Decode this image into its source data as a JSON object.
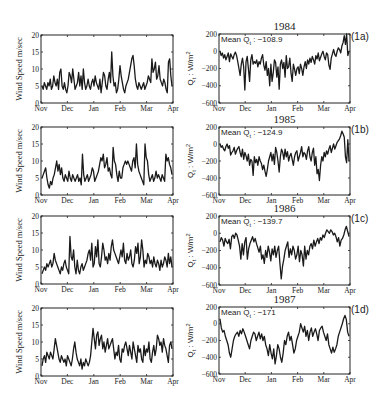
{
  "figure": {
    "months": [
      "Nov",
      "Dec",
      "Jan",
      "Feb",
      "Mar",
      "Apr"
    ],
    "left_ylabel": "Wind Speed m/sec",
    "right_ylabel": "Q_t : W/m^2",
    "left_yticks": [
      "0",
      "5",
      "10",
      "15",
      "20"
    ],
    "right_yticks": [
      "200",
      "0",
      "-200",
      "-400",
      "-600"
    ],
    "line_color": "#1a1a1a"
  },
  "chart_data": [
    {
      "type": "line",
      "panel": "1a-left",
      "title": "",
      "xlabel": "",
      "ylabel": "Wind Speed m/sec",
      "xticks": [
        "Nov",
        "Dec",
        "Jan",
        "Feb",
        "Mar",
        "Apr"
      ],
      "ylim": [
        0,
        20
      ],
      "yticks": [
        0,
        5,
        10,
        15,
        20
      ],
      "values": [
        5,
        4,
        6,
        5,
        4,
        6,
        5,
        7,
        4,
        5,
        8,
        6,
        5,
        7,
        4,
        9,
        10,
        5,
        4,
        6,
        4,
        3,
        5,
        9,
        8,
        6,
        10,
        7,
        4,
        5,
        6,
        9,
        5,
        8,
        4,
        10,
        6,
        4,
        5,
        7,
        5,
        4,
        6,
        7,
        5,
        8,
        6,
        5,
        4,
        7,
        3,
        6,
        9,
        8,
        5,
        4,
        7,
        9,
        6,
        15,
        8,
        5,
        6,
        3,
        4,
        7,
        11,
        8,
        6,
        4,
        3,
        5,
        6,
        7,
        9,
        11,
        13,
        14,
        11,
        7,
        5,
        4,
        6,
        5,
        4,
        5,
        6,
        4,
        5,
        6,
        8,
        7,
        6,
        13,
        9,
        10,
        12,
        7,
        8,
        11,
        7,
        6,
        5,
        7,
        6,
        4,
        3,
        12,
        13,
        8,
        5
      ]
    },
    {
      "type": "line",
      "panel": "1a-right",
      "title": "1984",
      "tag": "(1a)",
      "annotation": "Mean Q_t : -108.9",
      "mean": -108.9,
      "ylabel": "Q_t : W/m^2",
      "xticks": [
        "Nov",
        "Dec",
        "Jan",
        "Feb",
        "Mar",
        "Apr"
      ],
      "ylim": [
        -600,
        200
      ],
      "yticks": [
        200,
        0,
        -200,
        -400,
        -600
      ],
      "values": [
        0,
        -50,
        -20,
        -80,
        -40,
        -100,
        -60,
        -20,
        -120,
        -30,
        -60,
        -90,
        -40,
        -10,
        -50,
        -120,
        -200,
        -280,
        -150,
        -80,
        -180,
        -450,
        -120,
        -60,
        -200,
        -350,
        -100,
        -40,
        -150,
        -120,
        -140,
        -100,
        -180,
        -120,
        -150,
        -80,
        -40,
        -160,
        -220,
        -120,
        -280,
        -200,
        -400,
        -150,
        -350,
        -250,
        -100,
        -130,
        -300,
        -180,
        -440,
        -150,
        -100,
        -200,
        -130,
        -300,
        -50,
        -200,
        -180,
        -80,
        -250,
        -350,
        -150,
        -210,
        -280,
        -200,
        -180,
        -260,
        -150,
        -200,
        -280,
        -180,
        -120,
        -200,
        -100,
        -150,
        -80,
        -130,
        -60,
        -100,
        -150,
        -50,
        -90,
        -20,
        -110,
        -70,
        -30,
        0,
        -60,
        -100,
        -20,
        -40,
        -160,
        -210,
        -80,
        -30,
        20,
        -40,
        -60,
        0,
        40,
        20,
        -20,
        60,
        100,
        180,
        80,
        220,
        -50,
        0
      ]
    },
    {
      "type": "line",
      "panel": "1b-left",
      "ylabel": "Wind Speed m/sec",
      "xticks": [
        "Nov",
        "Dec",
        "Jan",
        "Feb",
        "Mar",
        "Apr"
      ],
      "ylim": [
        0,
        20
      ],
      "yticks": [
        0,
        5,
        10,
        15,
        20
      ],
      "values": [
        5,
        6,
        7,
        8,
        5,
        3,
        2,
        4,
        3,
        5,
        6,
        8,
        10,
        7,
        9,
        6,
        8,
        5,
        4,
        6,
        5,
        4,
        7,
        5,
        4,
        6,
        5,
        4,
        5,
        6,
        4,
        5,
        3,
        12,
        6,
        4,
        5,
        6,
        4,
        5,
        6,
        8,
        7,
        4,
        5,
        6,
        7,
        9,
        11,
        10,
        12,
        8,
        9,
        11,
        7,
        8,
        6,
        5,
        14,
        10,
        9,
        6,
        4,
        7,
        5,
        5,
        8,
        9,
        10,
        9,
        10,
        9,
        8,
        7,
        10,
        11,
        8,
        15,
        9,
        7,
        6,
        5,
        4,
        3,
        15,
        11,
        10,
        6,
        4,
        5,
        6,
        4,
        5,
        7,
        5,
        6,
        5,
        4,
        6,
        5,
        4,
        12,
        10,
        11,
        9,
        8,
        6
      ]
    },
    {
      "type": "line",
      "panel": "1b-right",
      "title": "1985",
      "tag": "(1b)",
      "annotation": "Mean Q_t : -124.9",
      "mean": -124.9,
      "ylabel": "Q_t : W/m^2",
      "xticks": [
        "Nov",
        "Dec",
        "Jan",
        "Feb",
        "Mar",
        "Apr"
      ],
      "ylim": [
        -600,
        200
      ],
      "yticks": [
        200,
        0,
        -200,
        -400,
        -600
      ],
      "values": [
        0,
        -40,
        -20,
        -60,
        -80,
        -30,
        0,
        -50,
        -20,
        -130,
        -100,
        -80,
        -40,
        -120,
        -80,
        -50,
        -30,
        -100,
        -150,
        -60,
        -180,
        -100,
        -140,
        -200,
        -120,
        -250,
        -180,
        -200,
        -370,
        -150,
        -220,
        -180,
        -250,
        -150,
        -200,
        -230,
        -300,
        -250,
        -320,
        -380,
        -300,
        -200,
        -150,
        -100,
        -200,
        -120,
        -240,
        -40,
        -100,
        -200,
        -330,
        -150,
        -60,
        -100,
        -180,
        -60,
        -150,
        -90,
        -200,
        -140,
        -110,
        -180,
        -250,
        -150,
        -100,
        -80,
        -200,
        -150,
        -100,
        -30,
        -150,
        -100,
        -120,
        -180,
        -80,
        -30,
        -150,
        -200,
        -100,
        -50,
        -250,
        -150,
        -350,
        -300,
        -430,
        -250,
        -150,
        -200,
        -100,
        -150,
        -80,
        -120,
        -60,
        -20,
        -100,
        -50,
        0,
        -60,
        -20,
        20,
        40,
        60,
        100,
        150,
        120,
        80,
        -150,
        -220,
        50,
        -200
      ]
    },
    {
      "type": "line",
      "panel": "1c-left",
      "ylabel": "Wind Speed m/sec",
      "xticks": [
        "Nov",
        "Dec",
        "Jan",
        "Feb",
        "Mar",
        "Apr"
      ],
      "ylim": [
        0,
        20
      ],
      "yticks": [
        0,
        5,
        10,
        15,
        20
      ],
      "values": [
        3,
        4,
        5,
        4,
        6,
        5,
        6,
        7,
        5,
        6,
        9,
        7,
        6,
        5,
        4,
        3,
        5,
        4,
        6,
        7,
        5,
        4,
        3,
        14,
        8,
        7,
        10,
        5,
        3,
        7,
        4,
        3,
        5,
        6,
        4,
        5,
        6,
        7,
        9,
        10,
        7,
        12,
        5,
        6,
        11,
        8,
        13,
        6,
        5,
        8,
        12,
        10,
        7,
        8,
        6,
        9,
        7,
        11,
        13,
        10,
        9,
        8,
        7,
        6,
        8,
        10,
        8,
        12,
        7,
        6,
        9,
        7,
        8,
        10,
        6,
        5,
        7,
        11,
        9,
        12,
        6,
        8,
        13,
        10,
        5,
        7,
        6,
        9,
        8,
        6,
        7,
        5,
        8,
        6,
        5,
        7,
        6,
        4,
        7,
        5,
        6,
        8,
        7,
        5,
        9,
        6,
        8,
        5
      ]
    },
    {
      "type": "line",
      "panel": "1c-right",
      "title": "1986",
      "tag": "(1c)",
      "annotation": "Mean Q_t : -139.7",
      "mean": -139.7,
      "ylabel": "Q_t : W/m^2",
      "xticks": [
        "Nov",
        "Dec",
        "Jan",
        "Feb",
        "Mar",
        "Apr"
      ],
      "ylim": [
        -600,
        200
      ],
      "yticks": [
        200,
        0,
        -200,
        -400,
        -600
      ],
      "values": [
        -100,
        -50,
        -80,
        -150,
        -60,
        -100,
        -120,
        -70,
        -180,
        -40,
        -20,
        -60,
        0,
        -20,
        -80,
        -150,
        -300,
        -120,
        -250,
        -100,
        -50,
        -300,
        -180,
        -120,
        -80,
        -40,
        -100,
        -60,
        -120,
        -170,
        -220,
        -150,
        -300,
        -250,
        -350,
        -200,
        -280,
        -150,
        -220,
        -320,
        -180,
        -250,
        -150,
        -280,
        -200,
        -150,
        -350,
        -530,
        -380,
        -300,
        -200,
        -150,
        -100,
        -280,
        -180,
        -250,
        -150,
        -200,
        -300,
        -250,
        -150,
        -330,
        -200,
        -250,
        -380,
        -150,
        -300,
        -200,
        -250,
        -150,
        -120,
        -180,
        -80,
        -150,
        -100,
        -60,
        -120,
        -50,
        -80,
        -20,
        -50,
        0,
        40,
        20,
        0,
        40,
        20,
        -20,
        0,
        -40,
        -100,
        -50,
        -150,
        -80,
        -60,
        -20,
        40,
        80,
        20,
        -40
      ]
    },
    {
      "type": "line",
      "panel": "1d-left",
      "ylabel": "Wind Speed m/sec",
      "xticks": [
        "Nov",
        "Dec",
        "Jan",
        "Feb",
        "Mar",
        "Apr"
      ],
      "ylim": [
        0,
        20
      ],
      "yticks": [
        0,
        5,
        10,
        15,
        20
      ],
      "values": [
        3,
        5,
        6,
        4,
        7,
        6,
        5,
        7,
        6,
        5,
        8,
        11,
        9,
        7,
        5,
        4,
        6,
        5,
        4,
        5,
        3,
        6,
        5,
        4,
        3,
        5,
        8,
        10,
        7,
        5,
        4,
        3,
        5,
        2,
        4,
        3,
        5,
        4,
        3,
        4,
        6,
        10,
        14,
        11,
        8,
        12,
        13,
        9,
        11,
        12,
        8,
        10,
        7,
        9,
        11,
        8,
        9,
        10,
        11,
        8,
        5,
        7,
        6,
        9,
        5,
        4,
        8,
        7,
        9,
        10,
        8,
        6,
        9,
        7,
        5,
        10,
        8,
        6,
        4,
        9,
        7,
        8,
        5,
        4,
        9,
        6,
        8,
        7,
        10,
        5,
        4,
        7,
        9,
        6,
        8,
        12,
        11,
        9,
        10,
        7,
        11,
        9,
        8,
        6,
        4,
        9,
        10,
        8
      ]
    },
    {
      "type": "line",
      "panel": "1d-right",
      "title": "1987",
      "tag": "(1d)",
      "annotation": "Mean Q_t : -171",
      "mean": -171,
      "ylabel": "Q_t : W/m^2",
      "xticks": [
        "Nov",
        "Dec",
        "Jan",
        "Feb",
        "Mar",
        "Apr"
      ],
      "ylim": [
        -600,
        200
      ],
      "yticks": [
        200,
        0,
        -200,
        -400,
        -600
      ],
      "values": [
        60,
        -50,
        -100,
        -80,
        -150,
        -200,
        -250,
        -350,
        -400,
        -300,
        -200,
        -150,
        -120,
        -100,
        -150,
        -80,
        -120,
        -60,
        -100,
        -150,
        -200,
        -250,
        -300,
        -200,
        -150,
        -100,
        -120,
        -200,
        -150,
        -100,
        -180,
        -120,
        -200,
        -150,
        -250,
        -300,
        -380,
        -250,
        -350,
        -420,
        -300,
        -480,
        -380,
        -250,
        -300,
        -400,
        -460,
        -350,
        -200,
        -250,
        -150,
        -100,
        -200,
        -150,
        -250,
        -350,
        -300,
        -200,
        -150,
        -100,
        0,
        -50,
        -100,
        -30,
        -150,
        -80,
        -200,
        -100,
        -50,
        -150,
        -100,
        -60,
        -120,
        -200,
        -80,
        -50,
        -30,
        -100,
        -150,
        -200,
        -120,
        -250,
        -300,
        -350,
        -280,
        -340,
        -300,
        -250,
        -150,
        -100,
        -50,
        0,
        60,
        100,
        50,
        -100,
        -150
      ]
    }
  ]
}
